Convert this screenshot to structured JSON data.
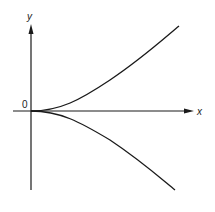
{
  "diagram": {
    "type": "curve-sketch",
    "axes": {
      "x_label": "x",
      "y_label": "y",
      "origin_label": "0"
    },
    "curves": [
      {
        "name": "upper-branch",
        "relation": "y = x^(3/2)"
      },
      {
        "name": "lower-branch",
        "relation": "y = -x^(3/2)"
      }
    ],
    "colors": {
      "line": "#1a1a1a",
      "background": "#ffffff"
    }
  }
}
